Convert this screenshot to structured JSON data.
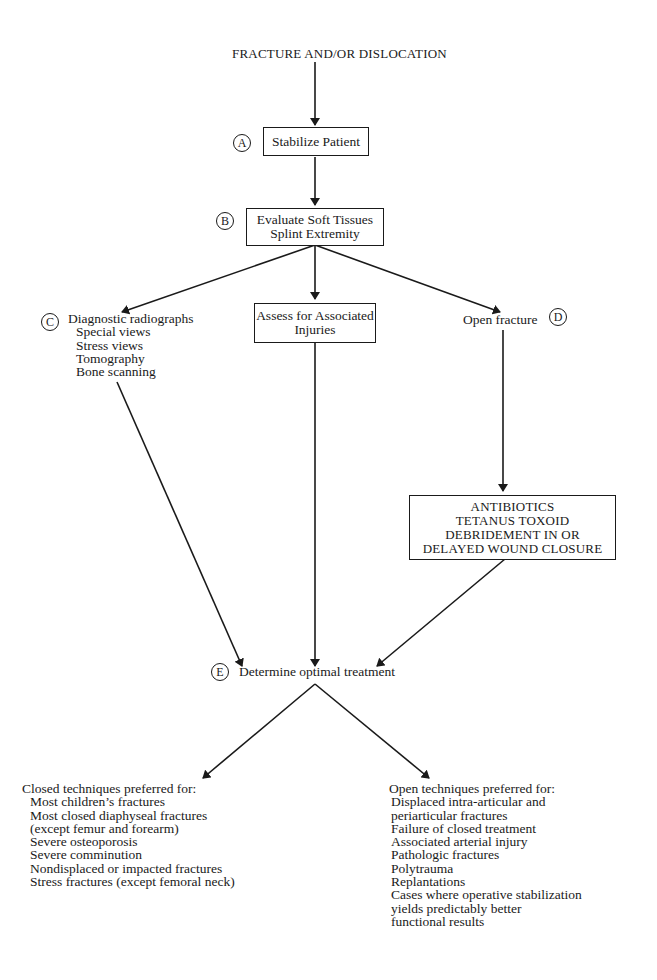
{
  "title": "FRACTURE AND/OR DISLOCATION",
  "steps": {
    "A": {
      "marker": "A",
      "label": "Stabilize Patient"
    },
    "B": {
      "marker": "B",
      "lines": [
        "Evaluate Soft Tissues",
        "Splint Extremity"
      ]
    },
    "C": {
      "marker": "C",
      "heading": "Diagnostic radiographs",
      "items": [
        "Special views",
        "Stress views",
        "Tomography",
        "Bone scanning"
      ]
    },
    "assoc": {
      "lines": [
        "Assess for Associated",
        "Injuries"
      ]
    },
    "D": {
      "marker": "D",
      "label": "Open fracture"
    },
    "open_mgmt": {
      "lines": [
        "ANTIBIOTICS",
        "TETANUS TOXOID",
        "DEBRIDEMENT IN OR",
        "DELAYED WOUND CLOSURE"
      ]
    },
    "E": {
      "marker": "E",
      "label": "Determine optimal treatment"
    }
  },
  "outcomes": {
    "closed": {
      "heading": "Closed techniques preferred for:",
      "items": [
        "Most children’s fractures",
        "Most closed diaphyseal fractures",
        "(except femur and forearm)",
        "Severe osteoporosis",
        "Severe comminution",
        "Nondisplaced or impacted fractures",
        "Stress fractures (except femoral neck)"
      ]
    },
    "open": {
      "heading": "Open techniques preferred for:",
      "items": [
        "Displaced intra-articular and",
        "periarticular fractures",
        "Failure of closed treatment",
        "Associated arterial injury",
        "Pathologic fractures",
        "Polytrauma",
        "Replantations",
        "Cases where operative stabilization",
        "yields predictably better",
        "functional results"
      ]
    }
  }
}
